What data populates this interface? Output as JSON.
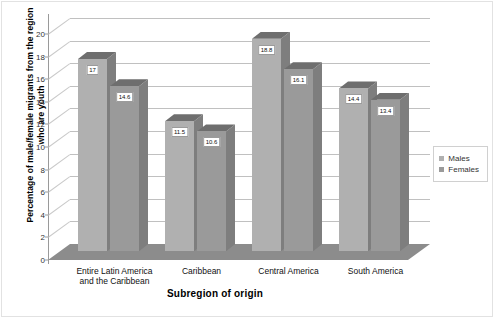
{
  "chart_data": {
    "type": "bar",
    "title": "",
    "subtitle": "",
    "xlabel": "Subregion of origin",
    "ylabel": "Percentage of male/female migrants from the region who are youth",
    "categories": [
      "Entire Latin America\nand the Caribbean",
      "Caribbean",
      "Central America",
      "South America"
    ],
    "series": [
      {
        "name": "Males",
        "values": [
          17,
          11.5,
          18.8,
          14.4
        ],
        "color": "#b0b0b0"
      },
      {
        "name": "Females",
        "values": [
          14.6,
          10.6,
          16.1,
          13.4
        ],
        "color": "#9a9a9a"
      }
    ],
    "value_labels": [
      [
        "17",
        "11.5",
        "18.8",
        "14.4"
      ],
      [
        "14.6",
        "10.6",
        "16.1",
        "13.4"
      ]
    ],
    "ylim": [
      0,
      20
    ],
    "yticks": [
      0,
      2,
      4,
      6,
      8,
      10,
      12,
      14,
      16,
      18,
      20
    ],
    "ytick_labels": [
      "0",
      "2",
      "4",
      "6",
      "8",
      "10",
      "12",
      "14",
      "16",
      "18",
      "20"
    ],
    "grid": true,
    "legend_position": "right",
    "three_d": true,
    "plot_background": "#ffffff",
    "floor_color": "#8c8c8c",
    "gridline_color": "#c9c9c9",
    "axis_color": "#9a9a9a"
  },
  "legend": {
    "entries": [
      {
        "label": "Males",
        "color": "#b0b0b0"
      },
      {
        "label": "Females",
        "color": "#9a9a9a"
      }
    ]
  }
}
